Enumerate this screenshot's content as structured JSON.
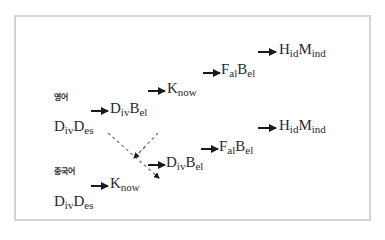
{
  "diagram": {
    "border_color": "#d4d4d4",
    "text_color": "#2a2a2a",
    "rows": [
      {
        "label": "영어",
        "start": {
          "main1": "D",
          "sub1": "iv",
          "main2": "D",
          "sub2": "es"
        },
        "steps": [
          {
            "main1": "D",
            "sub1": "iv",
            "main2": "B",
            "sub2": "el"
          },
          {
            "main1": "K",
            "sub1": "now",
            "main2": "",
            "sub2": ""
          },
          {
            "main1": "F",
            "sub1": "al",
            "main2": "B",
            "sub2": "el"
          },
          {
            "main1": "H",
            "sub1": "id",
            "main2": "M",
            "sub2": "ind"
          }
        ]
      },
      {
        "label": "중국어",
        "start": {
          "main1": "D",
          "sub1": "iv",
          "main2": "D",
          "sub2": "es"
        },
        "steps": [
          {
            "main1": "K",
            "sub1": "now",
            "main2": "",
            "sub2": ""
          },
          {
            "main1": "D",
            "sub1": "iv",
            "main2": "B",
            "sub2": "el"
          },
          {
            "main1": "F",
            "sub1": "al",
            "main2": "B",
            "sub2": "el"
          },
          {
            "main1": "H",
            "sub1": "id",
            "main2": "M",
            "sub2": "ind"
          }
        ]
      }
    ],
    "crossover_note": "dashed cross linking D_ivB_el (영어, step 1) and D_ivB_el (중국어, step 2)"
  }
}
